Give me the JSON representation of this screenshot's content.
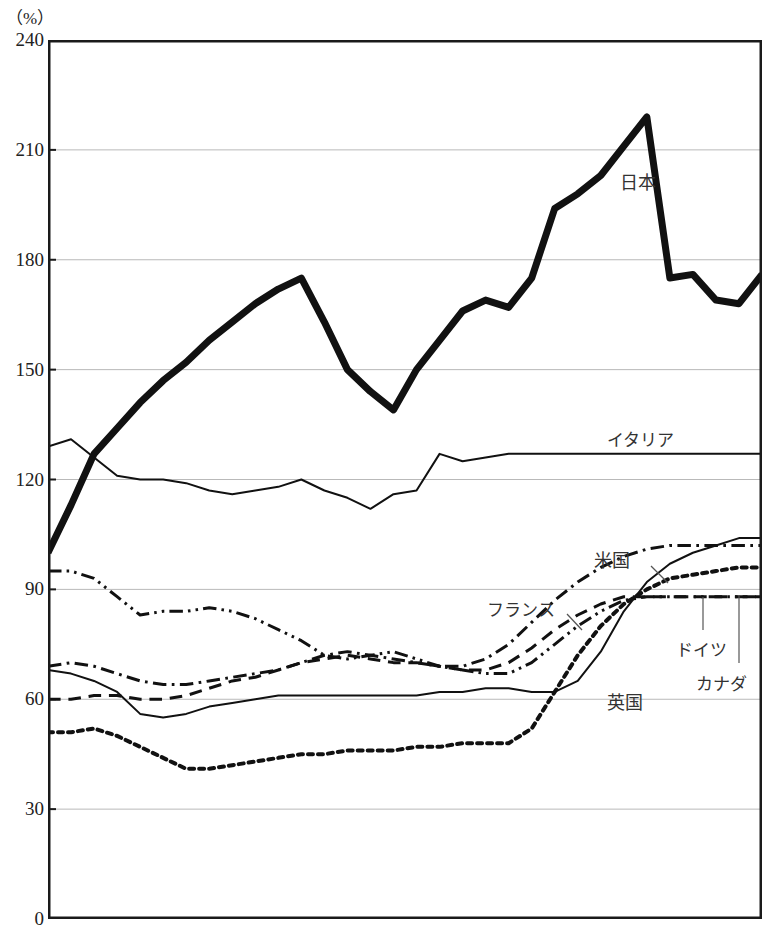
{
  "chart_data": {
    "type": "line",
    "title": "",
    "subtitle": "",
    "xlabel": "",
    "ylabel": "",
    "unit_label": "（%）",
    "ylim": [
      0,
      240
    ],
    "yticks": [
      0,
      30,
      60,
      90,
      120,
      150,
      180,
      210,
      240
    ],
    "ytick_labels": [
      "0",
      "30",
      "60",
      "90",
      "120",
      "150",
      "180",
      "210",
      "240"
    ],
    "grid": "horizontal",
    "legend_position": "inline-annotations",
    "x_axis_visible_labels": [],
    "x": [
      0,
      1,
      2,
      3,
      4,
      5,
      6,
      7,
      8,
      9,
      10,
      11,
      12,
      13,
      14,
      15,
      16,
      17,
      18,
      19,
      20,
      21,
      22,
      23,
      24,
      25,
      26,
      27,
      28,
      29,
      30,
      31
    ],
    "series": [
      {
        "name": "日本",
        "label": "日本",
        "style": "solid-thick",
        "stroke_width": 7,
        "values": [
          100,
          113,
          127,
          134,
          141,
          147,
          152,
          158,
          163,
          168,
          172,
          175,
          163,
          150,
          144,
          139,
          150,
          158,
          166,
          169,
          167,
          175,
          194,
          198,
          203,
          211,
          219,
          175,
          176,
          169,
          168,
          176
        ]
      },
      {
        "name": "イタリア",
        "label": "イタリア",
        "style": "solid-thin",
        "stroke_width": 2,
        "values": [
          129,
          131,
          126,
          121,
          120,
          120,
          119,
          117,
          116,
          117,
          118,
          120,
          117,
          115,
          112,
          116,
          117,
          127,
          125,
          126,
          127,
          127,
          127,
          127,
          127,
          127,
          127,
          127,
          127,
          127,
          127,
          127
        ]
      },
      {
        "name": "カナダ",
        "label": "カナダ",
        "style": "dash-dot-dot",
        "stroke_width": 3,
        "values": [
          95,
          95,
          93,
          88,
          83,
          84,
          84,
          85,
          84,
          82,
          79,
          76,
          72,
          71,
          72,
          73,
          71,
          69,
          68,
          67,
          67,
          70,
          75,
          80,
          84,
          87,
          88,
          88,
          88,
          88,
          88,
          88
        ]
      },
      {
        "name": "フランス",
        "label": "フランス",
        "style": "dash-dot",
        "stroke_width": 3,
        "values": [
          69,
          70,
          69,
          67,
          65,
          64,
          64,
          65,
          66,
          67,
          68,
          70,
          72,
          73,
          72,
          71,
          70,
          69,
          69,
          71,
          75,
          81,
          87,
          92,
          96,
          99,
          101,
          102,
          102,
          102,
          102,
          102
        ]
      },
      {
        "name": "米国",
        "label": "米国",
        "style": "solid-thin",
        "stroke_width": 2,
        "values": [
          68,
          67,
          65,
          62,
          56,
          55,
          56,
          58,
          59,
          60,
          61,
          61,
          61,
          61,
          61,
          61,
          61,
          62,
          62,
          63,
          63,
          62,
          62,
          65,
          73,
          84,
          92,
          97,
          100,
          102,
          104,
          104
        ]
      },
      {
        "name": "ドイツ",
        "label": "ドイツ",
        "style": "dashed",
        "stroke_width": 3,
        "values": [
          60,
          60,
          61,
          61,
          60,
          60,
          61,
          63,
          65,
          66,
          68,
          70,
          71,
          72,
          71,
          70,
          70,
          69,
          68,
          68,
          70,
          74,
          79,
          83,
          86,
          88,
          88,
          88,
          88,
          88,
          88,
          88
        ]
      },
      {
        "name": "英国",
        "label": "英国",
        "style": "dotted",
        "stroke_width": 4,
        "values": [
          51,
          51,
          52,
          50,
          47,
          44,
          41,
          41,
          42,
          43,
          44,
          45,
          45,
          46,
          46,
          46,
          47,
          47,
          48,
          48,
          48,
          52,
          62,
          72,
          80,
          86,
          90,
          93,
          94,
          95,
          96,
          96
        ]
      }
    ],
    "annotations": [
      {
        "text": "日本",
        "x_px": 620,
        "y_px": 168,
        "leader": false
      },
      {
        "text": "イタリア",
        "x_px": 607,
        "y_px": 426,
        "leader": false
      },
      {
        "text": "米国",
        "x_px": 594,
        "y_px": 546,
        "leader": true
      },
      {
        "text": "フランス",
        "x_px": 487,
        "y_px": 596,
        "leader": true
      },
      {
        "text": "ドイツ",
        "x_px": 676,
        "y_px": 636,
        "leader": true
      },
      {
        "text": "カナダ",
        "x_px": 696,
        "y_px": 670,
        "leader": true
      },
      {
        "text": "英国",
        "x_px": 607,
        "y_px": 688,
        "leader": false
      }
    ],
    "colors": {
      "line": "#111111",
      "grid": "#b9b9b9",
      "axis": "#1a1a1a",
      "text": "#222222",
      "background": "#ffffff"
    }
  }
}
